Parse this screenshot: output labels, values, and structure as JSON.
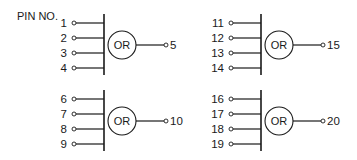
{
  "title": "PIN NO.",
  "gates": [
    {
      "id": "gate-a",
      "type_label": "OR",
      "inputs": [
        "1",
        "2",
        "3",
        "4"
      ],
      "output": "5"
    },
    {
      "id": "gate-b",
      "type_label": "OR",
      "inputs": [
        "11",
        "12",
        "13",
        "14"
      ],
      "output": "15"
    },
    {
      "id": "gate-c",
      "type_label": "OR",
      "inputs": [
        "6",
        "7",
        "8",
        "9"
      ],
      "output": "10"
    },
    {
      "id": "gate-d",
      "type_label": "OR",
      "inputs": [
        "16",
        "17",
        "18",
        "19"
      ],
      "output": "20"
    }
  ],
  "colors": {
    "ink": "#1a1a1a",
    "background": "#ffffff"
  }
}
